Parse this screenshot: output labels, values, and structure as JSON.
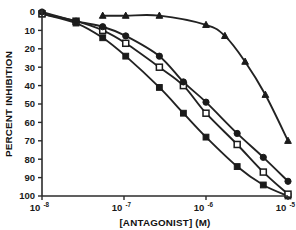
{
  "chart_data": {
    "type": "line",
    "title": "",
    "subtitle": "",
    "xlabel": "[ANTAGONIST] (M)",
    "ylabel": "PERCENT INHIBITION",
    "xscale": "log",
    "xlim": [
      1e-08,
      1e-05
    ],
    "ylim": [
      0,
      100
    ],
    "y_axis_inverted": true,
    "grid": false,
    "legend": "none",
    "x_tick_labels": [
      "10-8",
      "10-7",
      "10-6",
      "10-5"
    ],
    "x_tick_mantissa": "10",
    "x_tick_exponents": [
      "-8",
      "-7",
      "-6",
      "-5"
    ],
    "x_tick_values": [
      1e-08,
      1e-07,
      1e-06,
      1e-05
    ],
    "y_tick_labels": [
      "0",
      "10",
      "20",
      "30",
      "40",
      "50",
      "60",
      "70",
      "80",
      "90",
      "100"
    ],
    "y_tick_values": [
      0,
      10,
      20,
      30,
      40,
      50,
      60,
      70,
      80,
      90,
      100
    ],
    "series": [
      {
        "name": "filled-squares",
        "marker": "square-filled",
        "points": [
          {
            "x": 1e-08,
            "y": 1
          },
          {
            "x": 2.6e-08,
            "y": 6
          },
          {
            "x": 5.5e-08,
            "y": 14
          },
          {
            "x": 1.05e-07,
            "y": 24
          },
          {
            "x": 2.7e-07,
            "y": 41
          },
          {
            "x": 5.3e-07,
            "y": 55
          },
          {
            "x": 1e-06,
            "y": 68
          },
          {
            "x": 2.4e-06,
            "y": 84
          },
          {
            "x": 5e-06,
            "y": 94
          },
          {
            "x": 1e-05,
            "y": 100
          }
        ]
      },
      {
        "name": "open-squares",
        "marker": "square-open",
        "points": [
          {
            "x": 1e-08,
            "y": 1
          },
          {
            "x": 2.6e-08,
            "y": 5
          },
          {
            "x": 5.5e-08,
            "y": 10
          },
          {
            "x": 1.05e-07,
            "y": 17
          },
          {
            "x": 2.7e-07,
            "y": 30
          },
          {
            "x": 5.3e-07,
            "y": 40
          },
          {
            "x": 1e-06,
            "y": 55
          },
          {
            "x": 2.4e-06,
            "y": 72
          },
          {
            "x": 5e-06,
            "y": 87
          },
          {
            "x": 1e-05,
            "y": 99
          }
        ]
      },
      {
        "name": "filled-circles",
        "marker": "circle-filled",
        "points": [
          {
            "x": 1e-08,
            "y": 0
          },
          {
            "x": 2.6e-08,
            "y": 5
          },
          {
            "x": 5.5e-08,
            "y": 8
          },
          {
            "x": 1.05e-07,
            "y": 13
          },
          {
            "x": 2.7e-07,
            "y": 24
          },
          {
            "x": 5.3e-07,
            "y": 38
          },
          {
            "x": 1e-06,
            "y": 49
          },
          {
            "x": 2.4e-06,
            "y": 66
          },
          {
            "x": 5e-06,
            "y": 79
          },
          {
            "x": 1e-05,
            "y": 92
          }
        ]
      },
      {
        "name": "filled-triangles",
        "marker": "triangle-filled",
        "points": [
          {
            "x": 5.5e-08,
            "y": 2
          },
          {
            "x": 1.05e-07,
            "y": 2
          },
          {
            "x": 2.7e-07,
            "y": 2
          },
          {
            "x": 1e-06,
            "y": 7
          },
          {
            "x": 1.7e-06,
            "y": 13
          },
          {
            "x": 3e-06,
            "y": 27
          },
          {
            "x": 5.3e-06,
            "y": 45
          },
          {
            "x": 1e-05,
            "y": 70
          }
        ]
      }
    ]
  }
}
